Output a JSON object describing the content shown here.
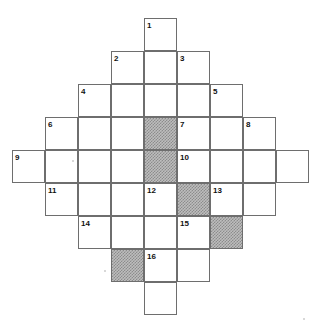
{
  "puzzle": {
    "type": "crossword-grid",
    "title": "Crossword Grid",
    "cell_size": 33,
    "grid_origin": {
      "x": 21,
      "y": 18
    },
    "colors": {
      "background": "#ffffff",
      "cell_fill": "#ffffff",
      "cell_border": "#6e6e6e",
      "shaded_fill": "#bdbdbd",
      "shaded_pattern": "#8c8c8c",
      "number_text": "#111111"
    },
    "columns_x": [
      21,
      54,
      87,
      111,
      144,
      177,
      210,
      236,
      269,
      302
    ],
    "rows_y": [
      18,
      51,
      84,
      117,
      150,
      183,
      216,
      244,
      277,
      310
    ],
    "cells": [
      {
        "name": "cell-r0c4",
        "x": 144,
        "y": 18,
        "w": 33,
        "h": 33,
        "shaded": false
      },
      {
        "name": "cell-r1c3",
        "x": 111,
        "y": 51,
        "w": 33,
        "h": 33,
        "shaded": false
      },
      {
        "name": "cell-r1c4",
        "x": 144,
        "y": 51,
        "w": 33,
        "h": 33,
        "shaded": false
      },
      {
        "name": "cell-r1c5",
        "x": 177,
        "y": 51,
        "w": 33,
        "h": 33,
        "shaded": false
      },
      {
        "name": "cell-r2c2",
        "x": 78,
        "y": 84,
        "w": 33,
        "h": 33,
        "shaded": false
      },
      {
        "name": "cell-r2c3",
        "x": 111,
        "y": 84,
        "w": 33,
        "h": 33,
        "shaded": false
      },
      {
        "name": "cell-r2c4",
        "x": 144,
        "y": 84,
        "w": 33,
        "h": 33,
        "shaded": false
      },
      {
        "name": "cell-r2c5",
        "x": 177,
        "y": 84,
        "w": 33,
        "h": 33,
        "shaded": false
      },
      {
        "name": "cell-r2c6",
        "x": 210,
        "y": 84,
        "w": 33,
        "h": 33,
        "shaded": false
      },
      {
        "name": "cell-r3c1",
        "x": 45,
        "y": 117,
        "w": 33,
        "h": 33,
        "shaded": false
      },
      {
        "name": "cell-r3c2",
        "x": 78,
        "y": 117,
        "w": 33,
        "h": 33,
        "shaded": false
      },
      {
        "name": "cell-r3c3",
        "x": 111,
        "y": 117,
        "w": 33,
        "h": 33,
        "shaded": false
      },
      {
        "name": "cell-r3c4",
        "x": 144,
        "y": 117,
        "w": 33,
        "h": 33,
        "shaded": true
      },
      {
        "name": "cell-r3c5",
        "x": 177,
        "y": 117,
        "w": 33,
        "h": 33,
        "shaded": false
      },
      {
        "name": "cell-r3c6",
        "x": 210,
        "y": 117,
        "w": 33,
        "h": 33,
        "shaded": false
      },
      {
        "name": "cell-r3c7",
        "x": 243,
        "y": 117,
        "w": 33,
        "h": 33,
        "shaded": false
      },
      {
        "name": "cell-r4c0",
        "x": 12,
        "y": 150,
        "w": 33,
        "h": 33,
        "shaded": false
      },
      {
        "name": "cell-r4c1",
        "x": 45,
        "y": 150,
        "w": 33,
        "h": 33,
        "shaded": false
      },
      {
        "name": "cell-r4c2",
        "x": 78,
        "y": 150,
        "w": 33,
        "h": 33,
        "shaded": false
      },
      {
        "name": "cell-r4c3",
        "x": 111,
        "y": 150,
        "w": 33,
        "h": 33,
        "shaded": false
      },
      {
        "name": "cell-r4c4",
        "x": 144,
        "y": 150,
        "w": 33,
        "h": 33,
        "shaded": true
      },
      {
        "name": "cell-r4c5",
        "x": 177,
        "y": 150,
        "w": 33,
        "h": 33,
        "shaded": false
      },
      {
        "name": "cell-r4c6",
        "x": 210,
        "y": 150,
        "w": 33,
        "h": 33,
        "shaded": false
      },
      {
        "name": "cell-r4c7",
        "x": 243,
        "y": 150,
        "w": 33,
        "h": 33,
        "shaded": false
      },
      {
        "name": "cell-r4c8",
        "x": 276,
        "y": 150,
        "w": 33,
        "h": 33,
        "shaded": false
      },
      {
        "name": "cell-r5c1",
        "x": 45,
        "y": 183,
        "w": 33,
        "h": 33,
        "shaded": false
      },
      {
        "name": "cell-r5c2",
        "x": 78,
        "y": 183,
        "w": 33,
        "h": 33,
        "shaded": false
      },
      {
        "name": "cell-r5c3",
        "x": 111,
        "y": 183,
        "w": 33,
        "h": 33,
        "shaded": false
      },
      {
        "name": "cell-r5c4",
        "x": 144,
        "y": 183,
        "w": 33,
        "h": 33,
        "shaded": false
      },
      {
        "name": "cell-r5c5",
        "x": 177,
        "y": 183,
        "w": 33,
        "h": 33,
        "shaded": true
      },
      {
        "name": "cell-r5c6",
        "x": 210,
        "y": 183,
        "w": 33,
        "h": 33,
        "shaded": false
      },
      {
        "name": "cell-r5c7",
        "x": 243,
        "y": 183,
        "w": 33,
        "h": 33,
        "shaded": false
      },
      {
        "name": "cell-r6c2",
        "x": 78,
        "y": 216,
        "w": 33,
        "h": 33,
        "shaded": false
      },
      {
        "name": "cell-r6c3",
        "x": 111,
        "y": 216,
        "w": 33,
        "h": 33,
        "shaded": false
      },
      {
        "name": "cell-r6c4",
        "x": 144,
        "y": 216,
        "w": 33,
        "h": 33,
        "shaded": false
      },
      {
        "name": "cell-r6c5",
        "x": 177,
        "y": 216,
        "w": 33,
        "h": 33,
        "shaded": false
      },
      {
        "name": "cell-r6c6",
        "x": 210,
        "y": 216,
        "w": 33,
        "h": 33,
        "shaded": true
      },
      {
        "name": "cell-r7c3",
        "x": 111,
        "y": 249,
        "w": 33,
        "h": 33,
        "shaded": true
      },
      {
        "name": "cell-r7c4",
        "x": 144,
        "y": 249,
        "w": 33,
        "h": 33,
        "shaded": false
      },
      {
        "name": "cell-r7c5",
        "x": 177,
        "y": 249,
        "w": 33,
        "h": 33,
        "shaded": false
      },
      {
        "name": "cell-r8c4",
        "x": 144,
        "y": 282,
        "w": 33,
        "h": 33,
        "shaded": false
      }
    ],
    "clue_numbers": [
      {
        "label": "1",
        "x": 147,
        "y": 22
      },
      {
        "label": "2",
        "x": 114,
        "y": 55
      },
      {
        "label": "3",
        "x": 180,
        "y": 55
      },
      {
        "label": "4",
        "x": 81,
        "y": 88
      },
      {
        "label": "5",
        "x": 213,
        "y": 88
      },
      {
        "label": "6",
        "x": 48,
        "y": 121
      },
      {
        "label": "7",
        "x": 180,
        "y": 121
      },
      {
        "label": "8",
        "x": 246,
        "y": 121
      },
      {
        "label": "9",
        "x": 15,
        "y": 154
      },
      {
        "label": "10",
        "x": 180,
        "y": 154
      },
      {
        "label": "11",
        "x": 48,
        "y": 187
      },
      {
        "label": "12",
        "x": 147,
        "y": 187
      },
      {
        "label": "13",
        "x": 213,
        "y": 187
      },
      {
        "label": "14",
        "x": 81,
        "y": 220
      },
      {
        "label": "15",
        "x": 180,
        "y": 220
      },
      {
        "label": "16",
        "x": 147,
        "y": 253
      }
    ]
  }
}
